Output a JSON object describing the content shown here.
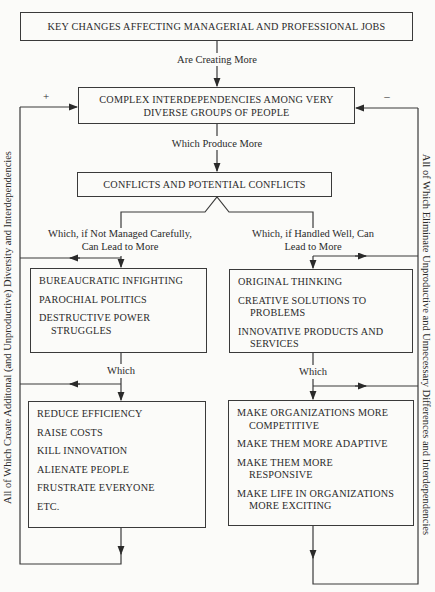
{
  "diagram": {
    "top_box": "KEY CHANGES AFFECTING MANAGERIAL AND PROFESSIONAL JOBS",
    "edge_1": "Are Creating More",
    "complex_box": {
      "line1": "COMPLEX INTERDEPENDENCIES AMONG VERY",
      "line2": "DIVERSE GROUPS OF PEOPLE"
    },
    "edge_2": "Which Produce More",
    "conflicts_box": "CONFLICTS AND POTENTIAL CONFLICTS",
    "left_branch_label": {
      "line1": "Which, if Not Managed Carefully,",
      "line2": "Can Lead to More"
    },
    "right_branch_label": {
      "line1": "Which, if Handled Well, Can",
      "line2": "Lead to More"
    },
    "negative_outcomes": [
      {
        "line1": "BUREAUCRATIC INFIGHTING",
        "line2": ""
      },
      {
        "line1": "PAROCHIAL POLITICS",
        "line2": ""
      },
      {
        "line1": "DESTRUCTIVE POWER",
        "line2": "STRUGGLES"
      }
    ],
    "positive_outcomes": [
      {
        "line1": "ORIGINAL THINKING",
        "line2": ""
      },
      {
        "line1": "CREATIVE SOLUTIONS TO",
        "line2": "PROBLEMS"
      },
      {
        "line1": "INNOVATIVE PRODUCTS AND",
        "line2": "SERVICES"
      }
    ],
    "left_which": "Which",
    "right_which": "Which",
    "negative_effects": [
      {
        "line1": "REDUCE EFFICIENCY",
        "line2": ""
      },
      {
        "line1": "RAISE COSTS",
        "line2": ""
      },
      {
        "line1": "KILL INNOVATION",
        "line2": ""
      },
      {
        "line1": "ALIENATE PEOPLE",
        "line2": ""
      },
      {
        "line1": "FRUSTRATE EVERYONE",
        "line2": ""
      },
      {
        "line1": "ETC.",
        "line2": ""
      }
    ],
    "positive_effects": [
      {
        "line1": "MAKE ORGANIZATIONS MORE",
        "line2": "COMPETITIVE"
      },
      {
        "line1": "MAKE THEM MORE ADAPTIVE",
        "line2": ""
      },
      {
        "line1": "MAKE THEM MORE",
        "line2": "RESPONSIVE"
      },
      {
        "line1": "MAKE LIFE IN ORGANIZATIONS",
        "line2": "MORE EXCITING"
      }
    ],
    "left_feedback_sign": "+",
    "right_feedback_sign": "–",
    "left_feedback_label": "All of Which Create Additonal (and Unproductive) Diversity and Interdependencies",
    "right_feedback_label": "All of Which Eliminate Unproductive and Unnecessary Differences and Interdependencies"
  }
}
